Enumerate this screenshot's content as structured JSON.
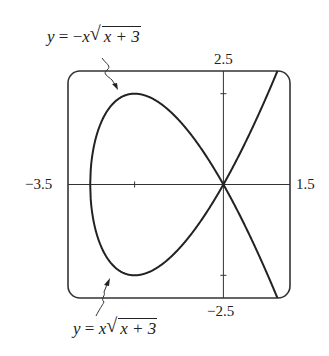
{
  "chart_data": {
    "type": "line",
    "title": "",
    "xlabel": "",
    "ylabel": "",
    "xlim": [
      -3.5,
      1.5
    ],
    "ylim": [
      -2.5,
      2.5
    ],
    "grid": false,
    "legend": "annotations",
    "tick_labels": {
      "x_min": "−3.5",
      "x_max": "1.5",
      "y_max": "2.5",
      "y_min": "−2.5"
    },
    "axis_ticks": {
      "x": [
        -2
      ],
      "y": [
        -2,
        2
      ]
    },
    "series": [
      {
        "name": "y = −x√(x + 3)",
        "formula": "-x*sqrt(x+3)",
        "sign": -1,
        "x": [
          -3,
          -2.5,
          -2,
          -1.5,
          -1,
          -0.5,
          0,
          0.5,
          1,
          1.5
        ],
        "y": [
          0,
          1.77,
          2.0,
          1.84,
          1.41,
          0.79,
          0,
          -0.94,
          -2.0,
          -3.19
        ]
      },
      {
        "name": "y = x√(x + 3)",
        "formula": "x*sqrt(x+3)",
        "sign": 1,
        "x": [
          -3,
          -2.5,
          -2,
          -1.5,
          -1,
          -0.5,
          0,
          0.5,
          1,
          1.5
        ],
        "y": [
          0,
          -1.77,
          -2.0,
          -1.84,
          -1.41,
          -0.79,
          0,
          0.94,
          2.0,
          3.19
        ]
      }
    ],
    "annotations": [
      {
        "text": "y = −x√(x + 3)",
        "points_to": "upper branch",
        "position": "top-left"
      },
      {
        "text": "y = x√(x + 3)",
        "points_to": "lower branch",
        "position": "bottom-left"
      }
    ]
  },
  "labels": {
    "x_min": "−3.5",
    "x_max": "1.5",
    "y_max": "2.5",
    "y_min": "−2.5",
    "eq_top": {
      "lhs": "y",
      "eq": " = −",
      "x": "x",
      "rad_arg": "x + 3"
    },
    "eq_bottom": {
      "lhs": "y",
      "eq": " = ",
      "x": "x",
      "rad_arg": "x + 3"
    }
  },
  "style": {
    "line_color": "#222222",
    "frame_color": "#333333"
  }
}
